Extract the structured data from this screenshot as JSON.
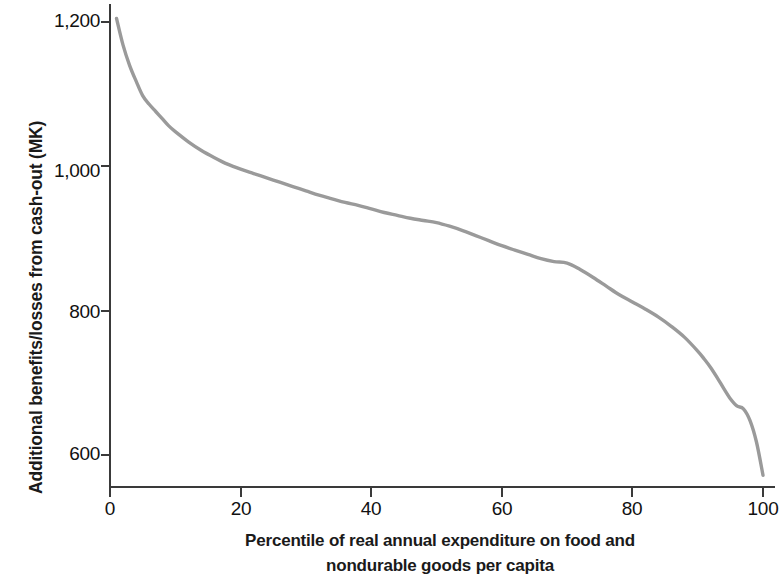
{
  "chart_data": {
    "type": "line",
    "title": "",
    "subtitle": "",
    "xlabel_line1": "Percentile of real annual expenditure on food and",
    "xlabel_line2": "nondurable goods per capita",
    "xlabel": "Percentile of real annual expenditure on food and nondurable goods per capita",
    "ylabel": "Additional benefits/losses from cash-out (MK)",
    "xlim": [
      0,
      100
    ],
    "ylim": [
      540,
      1240
    ],
    "xticks": [
      0,
      20,
      40,
      60,
      80,
      100
    ],
    "xtick_labels": [
      "0",
      "20",
      "40",
      "60",
      "80",
      "100"
    ],
    "yticks": [
      600,
      800,
      1000,
      1200
    ],
    "ytick_labels": [
      "600",
      "800",
      "1,000",
      "1,200"
    ],
    "grid": false,
    "legend": false,
    "legend_position": "none",
    "line_color": "#9a9a9a",
    "axis_color": "#3a3a3a",
    "background_color": "#ffffff",
    "series": [
      {
        "name": "Additional benefits/losses from cash-out",
        "x": [
          1,
          2,
          3,
          4,
          5,
          6,
          7,
          8,
          9,
          10,
          12,
          14,
          16,
          18,
          20,
          22,
          24,
          26,
          28,
          30,
          32,
          34,
          36,
          38,
          40,
          42,
          44,
          46,
          48,
          50,
          52,
          54,
          56,
          58,
          60,
          62,
          64,
          66,
          68,
          70,
          72,
          74,
          76,
          78,
          80,
          82,
          84,
          86,
          88,
          90,
          91,
          92,
          93,
          94,
          95,
          96,
          97,
          98,
          99,
          100
        ],
        "values": [
          1205,
          1168,
          1140,
          1118,
          1098,
          1086,
          1076,
          1066,
          1056,
          1048,
          1034,
          1022,
          1012,
          1003,
          996,
          990,
          984,
          978,
          972,
          966,
          960,
          955,
          950,
          946,
          941,
          936,
          932,
          928,
          925,
          922,
          917,
          911,
          904,
          897,
          890,
          884,
          878,
          872,
          868,
          866,
          857,
          846,
          834,
          822,
          812,
          802,
          791,
          778,
          763,
          744,
          733,
          721,
          707,
          692,
          678,
          668,
          664,
          648,
          618,
          572
        ]
      }
    ]
  },
  "axes": {
    "ytick_labels": [
      "1,200",
      "1,000",
      "800",
      "600"
    ],
    "xtick_labels": [
      "0",
      "20",
      "40",
      "60",
      "80",
      "100"
    ]
  }
}
